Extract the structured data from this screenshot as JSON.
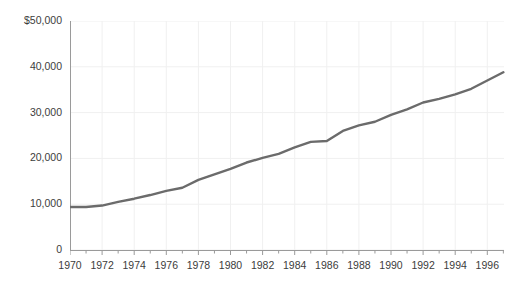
{
  "chart_data": {
    "type": "line",
    "title": "",
    "subtitle": "",
    "xlabel": "",
    "ylabel": "",
    "xlim": [
      1970,
      1997
    ],
    "ylim": [
      0,
      50000
    ],
    "grid": true,
    "legend_position": "none",
    "line_color": "#6b6b6b",
    "axis_color": "#9a9a9a",
    "grid_color": "#f0f0f0",
    "text_color": "#3c3c3c",
    "y_ticks": [
      {
        "value": 50000,
        "label": "$50,000"
      },
      {
        "value": 40000,
        "label": "40,000"
      },
      {
        "value": 30000,
        "label": "30,000"
      },
      {
        "value": 20000,
        "label": "20,000"
      },
      {
        "value": 10000,
        "label": "10,000"
      },
      {
        "value": 0,
        "label": "0"
      }
    ],
    "x_ticks_major": [
      {
        "value": 1970,
        "label": "1970"
      },
      {
        "value": 1972,
        "label": "1972"
      },
      {
        "value": 1974,
        "label": "1974"
      },
      {
        "value": 1976,
        "label": "1976"
      },
      {
        "value": 1978,
        "label": "1978"
      },
      {
        "value": 1980,
        "label": "1980"
      },
      {
        "value": 1982,
        "label": "1982"
      },
      {
        "value": 1984,
        "label": "1984"
      },
      {
        "value": 1986,
        "label": "1986"
      },
      {
        "value": 1988,
        "label": "1988"
      },
      {
        "value": 1990,
        "label": "1990"
      },
      {
        "value": 1992,
        "label": "1992"
      },
      {
        "value": 1994,
        "label": "1994"
      },
      {
        "value": 1996,
        "label": "1996"
      }
    ],
    "x_ticks_minor": [
      1971,
      1973,
      1975,
      1977,
      1979,
      1981,
      1983,
      1985,
      1987,
      1989,
      1991,
      1993,
      1995,
      1997
    ],
    "x": [
      1970,
      1971,
      1972,
      1973,
      1974,
      1975,
      1976,
      1977,
      1978,
      1979,
      1980,
      1981,
      1982,
      1983,
      1984,
      1985,
      1986,
      1987,
      1988,
      1989,
      1990,
      1991,
      1992,
      1993,
      1994,
      1995,
      1996,
      1997
    ],
    "values": [
      9400,
      9400,
      9700,
      10500,
      11200,
      12000,
      12900,
      13600,
      15300,
      16500,
      17700,
      19100,
      20100,
      21000,
      22400,
      23600,
      23800,
      26000,
      27200,
      28000,
      29500,
      30700,
      32200,
      33000,
      34000,
      35200,
      37000,
      38800
    ],
    "series": [
      {
        "name": "Median household income",
        "values": [
          9400,
          9400,
          9700,
          10500,
          11200,
          12000,
          12900,
          13600,
          15300,
          16500,
          17700,
          19100,
          20100,
          21000,
          22400,
          23600,
          23800,
          26000,
          27200,
          28000,
          29500,
          30700,
          32200,
          33000,
          34000,
          35200,
          37000,
          38800
        ]
      }
    ],
    "annotations": []
  }
}
